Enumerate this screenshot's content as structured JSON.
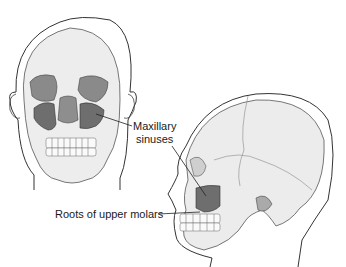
{
  "diagram": {
    "views": [
      {
        "id": "frontal",
        "label": "frontal-skull-view"
      },
      {
        "id": "lateral",
        "label": "lateral-skull-view"
      }
    ],
    "labels": {
      "maxillary_line1": "Maxillary",
      "maxillary_line2": "sinuses",
      "roots": "Roots of upper molars"
    },
    "colors": {
      "bone": "#ececec",
      "bone_shadow": "#cfcfcf",
      "sinus": "#6e6e6e",
      "outline": "#3a3a3a",
      "background": "#ffffff"
    }
  }
}
